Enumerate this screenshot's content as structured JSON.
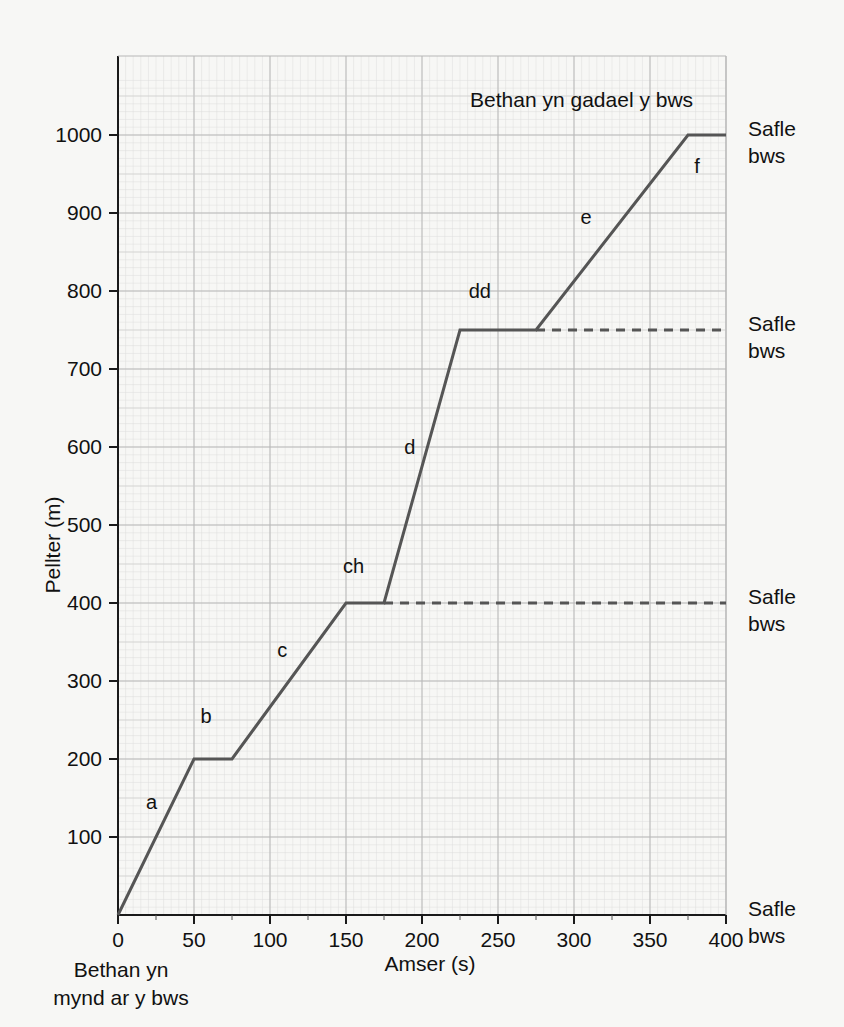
{
  "chart_data": {
    "type": "line",
    "title": "",
    "xlabel": "Amser (s)",
    "ylabel": "Pellter (m)",
    "xlim": [
      0,
      400
    ],
    "ylim": [
      0,
      1075
    ],
    "xticks": [
      0,
      50,
      100,
      150,
      200,
      250,
      300,
      350,
      400
    ],
    "yticks": [
      100,
      200,
      300,
      400,
      500,
      600,
      700,
      800,
      900,
      1000
    ],
    "x_minor_step": 25,
    "y_minor_step": 50,
    "grid": true,
    "legend": "none",
    "line_color": "#555555",
    "grid_color": "#b7b7b7",
    "minor_grid_color": "#dcdcdc",
    "background": "#f7f7f5",
    "series": [
      {
        "name": "Taith Bethan",
        "points": [
          {
            "x": 0,
            "y": 0
          },
          {
            "x": 50,
            "y": 200
          },
          {
            "x": 75,
            "y": 200
          },
          {
            "x": 150,
            "y": 400
          },
          {
            "x": 175,
            "y": 400
          },
          {
            "x": 225,
            "y": 750
          },
          {
            "x": 275,
            "y": 750
          },
          {
            "x": 375,
            "y": 1000
          },
          {
            "x": 400,
            "y": 1000
          }
        ]
      }
    ],
    "segment_labels": [
      {
        "id": "a",
        "label": "a",
        "x": 22,
        "y": 145
      },
      {
        "id": "b",
        "label": "b",
        "x": 58,
        "y": 255
      },
      {
        "id": "c",
        "label": "c",
        "x": 108,
        "y": 340
      },
      {
        "id": "ch",
        "label": "ch",
        "x": 155,
        "y": 448
      },
      {
        "id": "d",
        "label": "d",
        "x": 192,
        "y": 600
      },
      {
        "id": "dd",
        "label": "dd",
        "x": 238,
        "y": 800
      },
      {
        "id": "e",
        "label": "e",
        "x": 308,
        "y": 895
      },
      {
        "id": "f",
        "label": "f",
        "x": 381,
        "y": 960
      }
    ],
    "dashed_guides": [
      {
        "from_x": 175,
        "to_x": 400,
        "y": 400
      },
      {
        "from_x": 275,
        "to_x": 400,
        "y": 750
      }
    ],
    "annotations": [
      {
        "id": "leave-bus",
        "text": "Bethan yn gadael y bws",
        "x": 305,
        "y": 1045,
        "anchor": "middle"
      },
      {
        "id": "board-bus-line1",
        "text": "Bethan yn",
        "x": 2,
        "y": -95,
        "anchor": "middle"
      },
      {
        "id": "board-bus-line2",
        "text": "mynd ar y bws",
        "x": 2,
        "y": -130,
        "anchor": "middle"
      }
    ],
    "right_labels": [
      {
        "id": "stop-1000",
        "line1": "Safle",
        "line2": "bws",
        "y": 1000
      },
      {
        "id": "stop-750",
        "line1": "Safle",
        "line2": "bws",
        "y": 750
      },
      {
        "id": "stop-400",
        "line1": "Safle",
        "line2": "bws",
        "y": 400
      },
      {
        "id": "stop-0",
        "line1": "Safle",
        "line2": "bws",
        "y": 0
      }
    ]
  },
  "axes": {
    "y_title": "Pellter (m)",
    "x_title": "Amser (s)",
    "x_tick_labels": [
      "0",
      "50",
      "100",
      "150",
      "200",
      "250",
      "300",
      "350",
      "400"
    ],
    "y_tick_labels": [
      "100",
      "200",
      "300",
      "400",
      "500",
      "600",
      "700",
      "800",
      "900",
      "1000"
    ]
  },
  "annotations": {
    "leave_bus": "Bethan yn gadael y bws",
    "board_bus_line1": "Bethan yn",
    "board_bus_line2": "mynd ar y bws"
  },
  "stops": {
    "label_line1": "Safle",
    "label_line2": "bws"
  },
  "segments": {
    "a": "a",
    "b": "b",
    "c": "c",
    "ch": "ch",
    "d": "d",
    "dd": "dd",
    "e": "e",
    "f": "f"
  }
}
